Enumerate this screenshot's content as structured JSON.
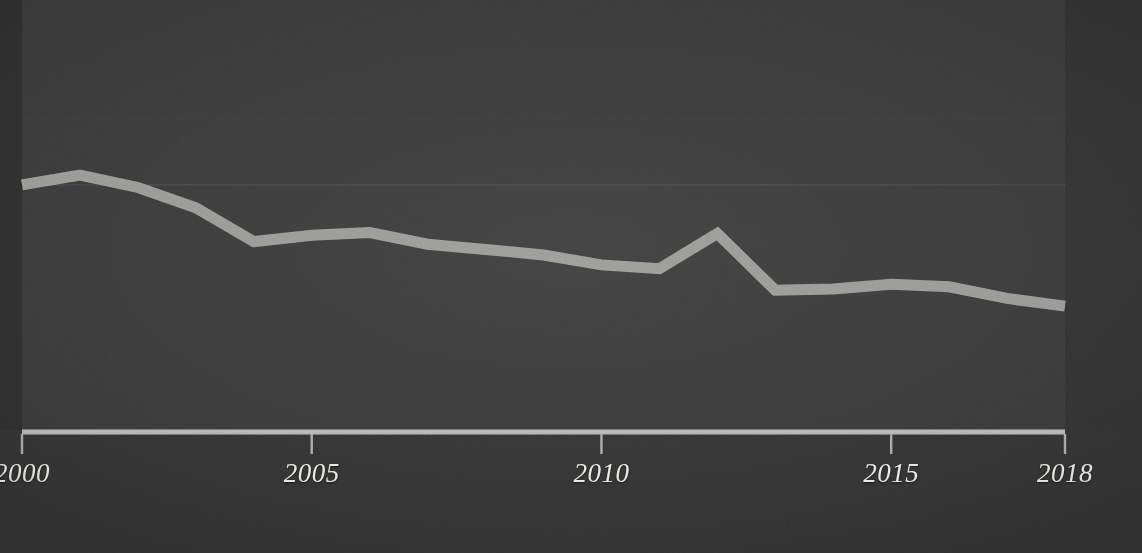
{
  "chart_data": {
    "type": "line",
    "title": "",
    "subtitle": "",
    "xlabel": "",
    "ylabel": "",
    "grid": true,
    "legend": "none",
    "xlim": [
      2000,
      2018
    ],
    "ylim": [
      0,
      100
    ],
    "xticks": [
      {
        "value": 2000,
        "label": "2000"
      },
      {
        "value": 2005,
        "label": "2005"
      },
      {
        "value": 2010,
        "label": "2010"
      },
      {
        "value": 2015,
        "label": "2015"
      },
      {
        "value": 2018,
        "label": "2018"
      }
    ],
    "yticks": [],
    "ytick_labels": [],
    "gridlines_y": [
      72.5,
      57.0
    ],
    "x": [
      2000,
      2001,
      2002,
      2003,
      2004,
      2005,
      2006,
      2007,
      2008,
      2009,
      2010,
      2011,
      2012,
      2013,
      2014,
      2015,
      2016,
      2017,
      2018
    ],
    "series": [
      {
        "name": "series-1",
        "color": "#9d9d99",
        "values": [
          57.0,
          59.3,
          56.4,
          51.7,
          43.8,
          45.3,
          45.9,
          43.2,
          42.0,
          40.7,
          38.4,
          37.5,
          45.7,
          32.5,
          32.8,
          33.9,
          33.3,
          30.6,
          28.8
        ]
      }
    ],
    "annotations": [],
    "colors": {
      "background": "#343434",
      "plot_background": "#393939",
      "line": "#9d9d99",
      "axis": "#b4b4b0",
      "tick_label": "#e9e9e4",
      "gridline": "#444747"
    }
  },
  "chart_geometry": {
    "plot_left": 22,
    "plot_right": 1065,
    "plot_top": 0,
    "plot_bottom": 430,
    "axis_y": 432,
    "value_to_y_top": 0,
    "value_to_y_bottom": 430
  }
}
